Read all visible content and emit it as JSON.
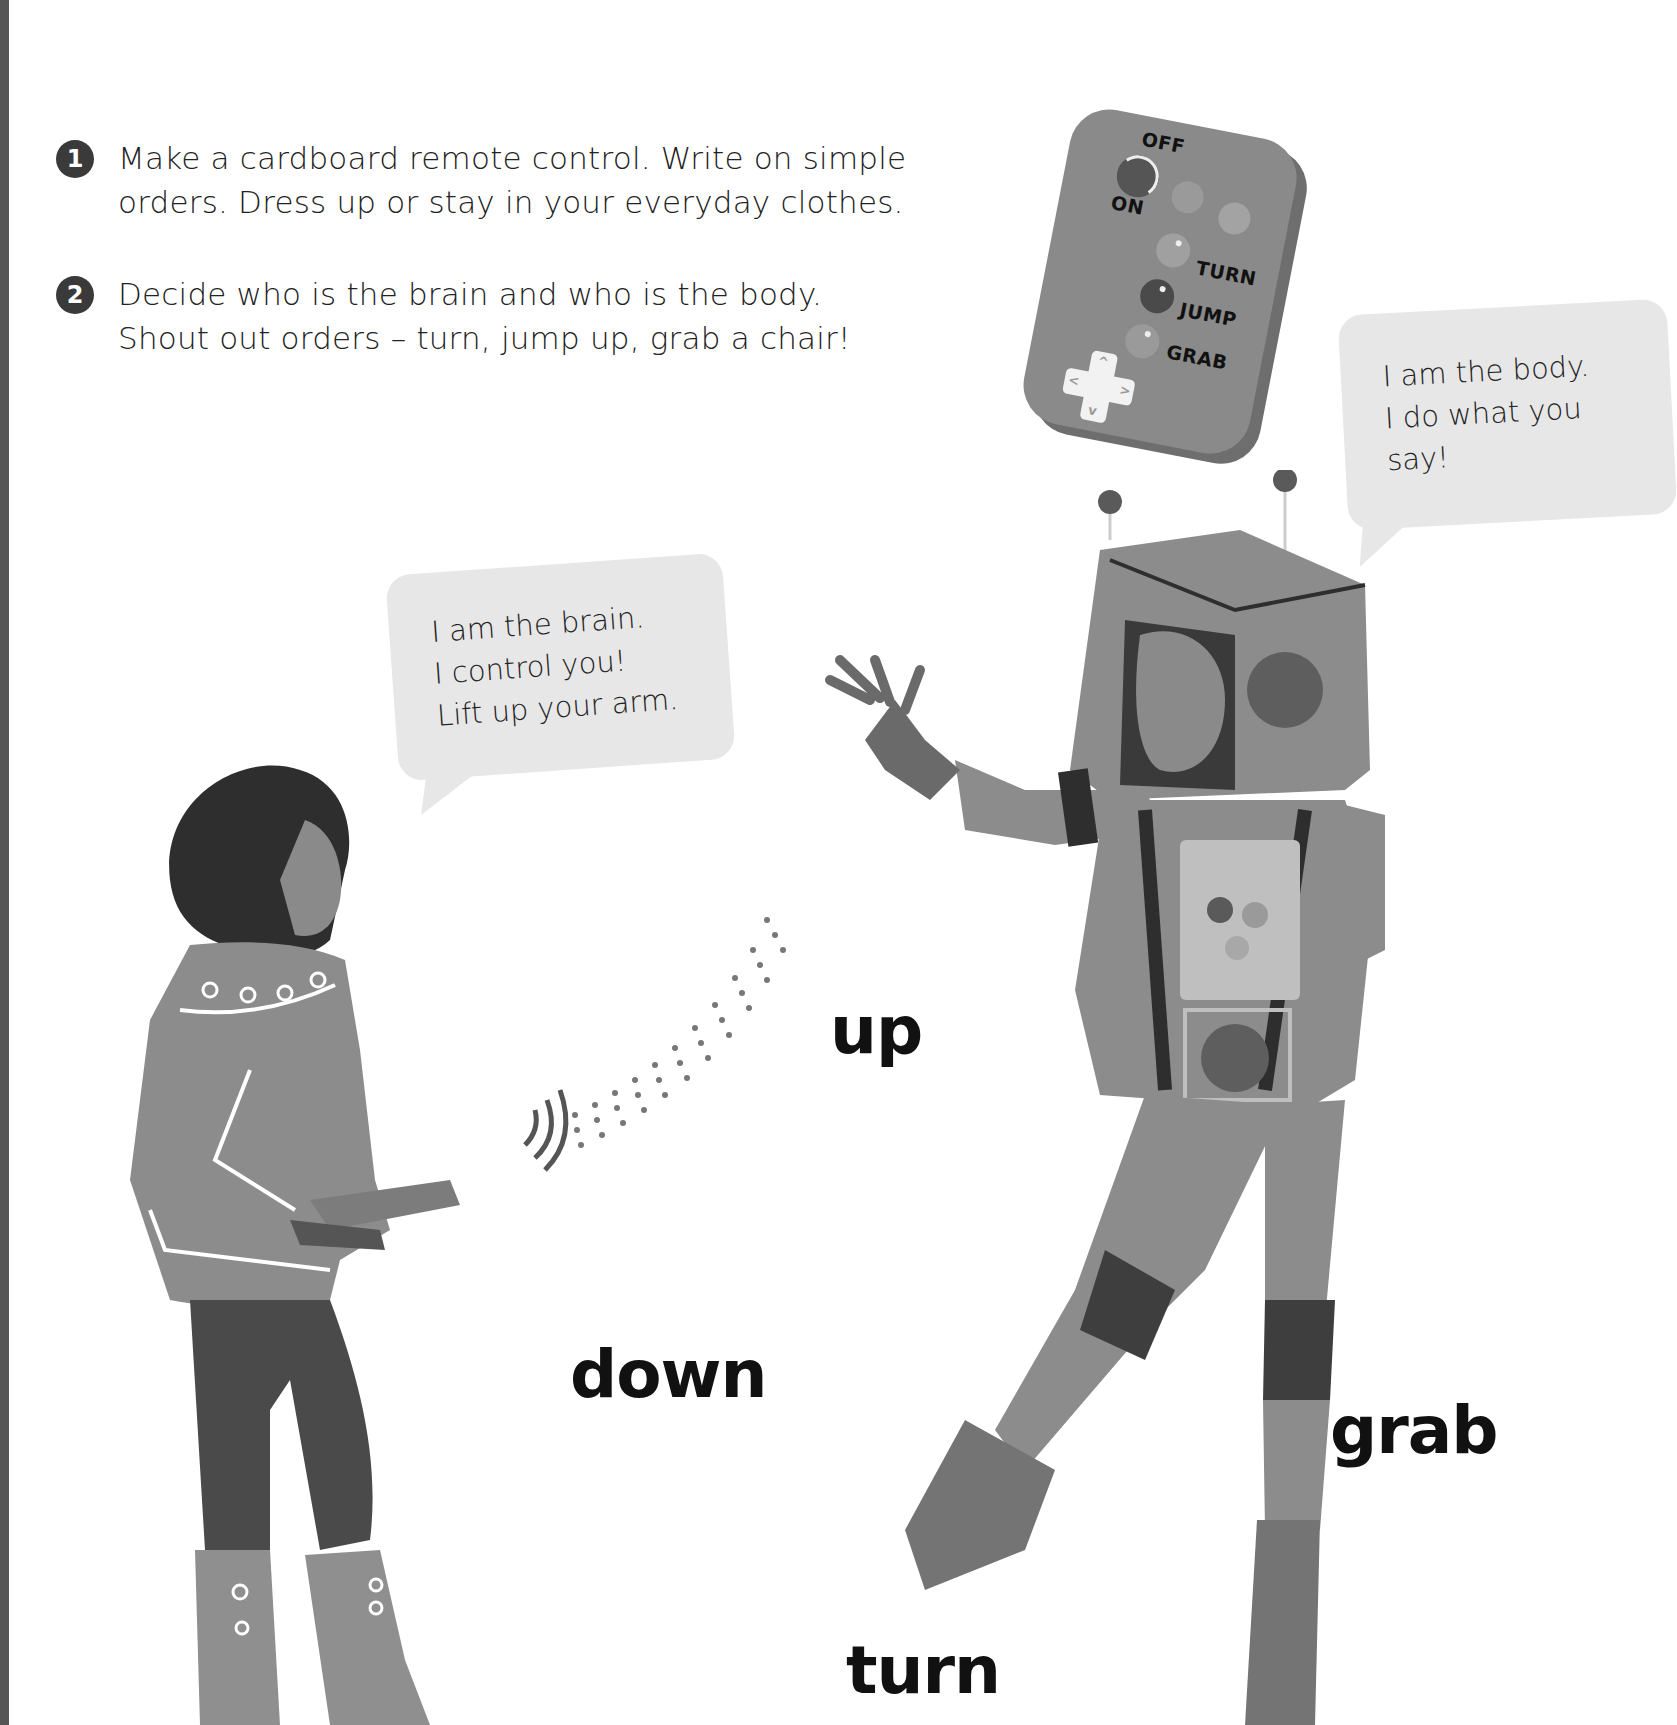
{
  "page": {
    "cutoff_header_text": "…, jump, turn, and up…"
  },
  "instructions": [
    {
      "number": "1",
      "lines": [
        "Make a cardboard remote control. Write on simple",
        "orders. Dress up or stay in your everyday clothes."
      ]
    },
    {
      "number": "2",
      "lines": [
        "Decide who is the brain and who is the body.",
        "Shout out orders – turn, jump up, grab a chair!"
      ]
    }
  ],
  "remote_control": {
    "labels": {
      "off": "OFF",
      "on": "ON",
      "turn": "TURN",
      "jump": "JUMP",
      "grab": "GRAB"
    },
    "dpad_arrows": [
      "^",
      "<",
      ">",
      "v"
    ]
  },
  "speech_bubbles": {
    "body": {
      "lines": [
        "I am the body.",
        "I do what you",
        "say!"
      ]
    },
    "brain": {
      "lines": [
        "I am the brain.",
        "I control you!",
        "Lift up your arm."
      ]
    }
  },
  "action_words": {
    "up": "up",
    "down": "down",
    "grab": "grab",
    "turn": "turn"
  },
  "colors": {
    "spine": "#555555",
    "bubble_fill": "#e7e7e7",
    "costume_gray": "#8c8c8c",
    "dark_gray": "#3f3f3f",
    "text": "#1a1a1a"
  }
}
